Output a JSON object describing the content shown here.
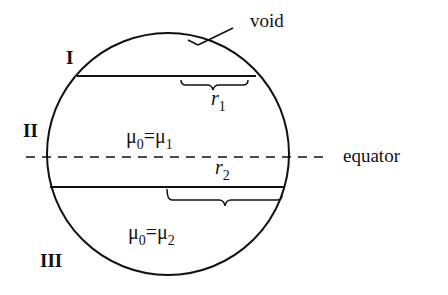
{
  "diagram": {
    "labels": {
      "void": "void",
      "equator": "equator",
      "region_I": "I",
      "region_II": "II",
      "region_III": "III"
    },
    "equations": {
      "upper": {
        "lhs": "μ",
        "lhs_sub": "0",
        "eq": "=",
        "rhs": "μ",
        "rhs_sub": "1"
      },
      "lower": {
        "lhs": "μ",
        "lhs_sub": "0",
        "eq": "=",
        "rhs": "μ",
        "rhs_sub": "2"
      }
    },
    "radii": {
      "r1": {
        "sym": "r",
        "sub": "1"
      },
      "r2": {
        "sym": "r",
        "sub": "2"
      }
    },
    "colors": {
      "stroke": "#111111",
      "background": "#ffffff"
    }
  }
}
